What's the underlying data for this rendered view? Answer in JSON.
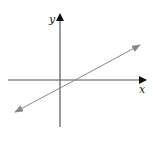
{
  "diagram": {
    "type": "coordinate-plane-line",
    "x_axis_label": "x",
    "y_axis_label": "y",
    "colors": {
      "axis": "#111111",
      "line": "#888888",
      "background": "#ffffff"
    }
  }
}
